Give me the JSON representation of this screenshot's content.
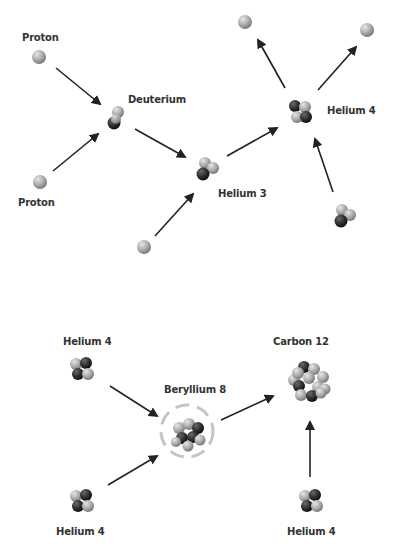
{
  "labels": {
    "proton_top": "Proton",
    "proton_bottom": "Proton",
    "deuterium": "Deuterium",
    "helium3": "Helium 3",
    "helium4_top": "Helium 4",
    "helium4_a": "Helium 4",
    "helium4_b": "Helium 4",
    "helium4_c": "Helium 4",
    "beryllium8": "Beryllium 8",
    "carbon12": "Carbon 12"
  },
  "colors": {
    "light_particle": "#b0b0b0",
    "dark_particle": "#2e2e2e",
    "arrow": "#222222",
    "text": "#333333"
  }
}
